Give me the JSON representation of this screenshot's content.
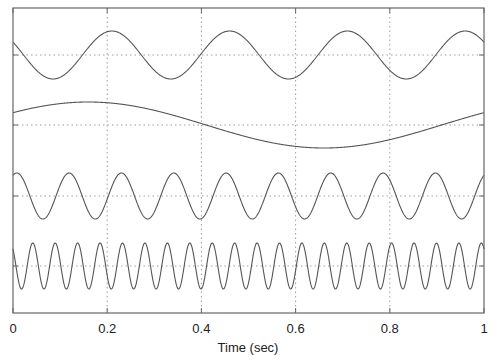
{
  "chart_data": {
    "type": "line",
    "title": "",
    "xlabel": "Time (sec)",
    "ylabel": "",
    "xlim": [
      0,
      1
    ],
    "x_ticks": [
      0,
      0.2,
      0.4,
      0.6,
      0.8,
      1
    ],
    "x_tick_labels": [
      "0",
      "0.2",
      "0.4",
      "0.6",
      "0.8",
      "1"
    ],
    "y_tick_labels": [],
    "grid": true,
    "legend": null,
    "layout": "four stacked sinusoids with vertical offsets, each with its own dotted baseline gridline",
    "series": [
      {
        "name": "signal-1",
        "frequency_hz": 4,
        "amplitude": 1,
        "peak_time": 0.21,
        "offset_level": 3
      },
      {
        "name": "signal-2",
        "frequency_hz": 1,
        "amplitude": 1,
        "peak_time": 0.16,
        "offset_level": 2
      },
      {
        "name": "signal-3",
        "frequency_hz": 9,
        "amplitude": 1,
        "peak_time": 0.008,
        "offset_level": 1
      },
      {
        "name": "signal-4",
        "frequency_hz": 21,
        "amplitude": 1,
        "peak_time": 0.042,
        "offset_level": 0
      }
    ]
  },
  "colors": {
    "line": "#555555",
    "axis": "#666666",
    "grid": "#888888"
  }
}
